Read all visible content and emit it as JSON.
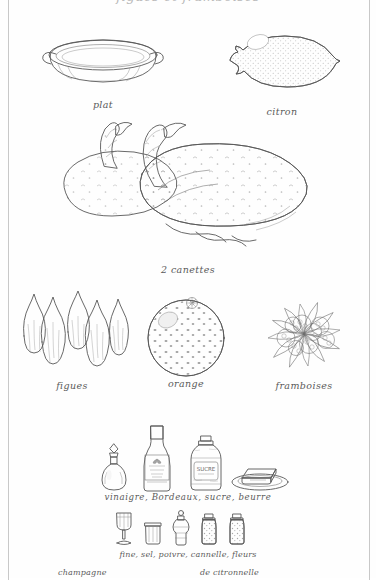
{
  "page": {
    "top_cut_text": "figues et framboises",
    "background_color": "#fefefe",
    "frame_color": "#c8c8c8",
    "ink_color": "#585858"
  },
  "rows": [
    {
      "name": "row-dish-lemon",
      "items": [
        {
          "name": "plat",
          "caption": "plat",
          "icon": "oval-gratin-dish"
        },
        {
          "name": "citron",
          "caption": "citron",
          "icon": "lemon"
        }
      ]
    },
    {
      "name": "row-ducks",
      "items": [
        {
          "name": "canettes",
          "caption": "2 canettes",
          "icon": "two-plucked-ducks"
        }
      ]
    },
    {
      "name": "row-fruit",
      "items": [
        {
          "name": "figues",
          "caption": "figues",
          "icon": "five-figs"
        },
        {
          "name": "orange",
          "caption": "orange",
          "icon": "orange"
        },
        {
          "name": "framboises",
          "caption": "framboises",
          "icon": "raspberries-on-leaves"
        }
      ]
    },
    {
      "name": "row-pantry",
      "caption": "vinaigre, Bordeaux, sucre,   beurre",
      "items": [
        {
          "name": "vinaigre",
          "icon": "cruet-bottle"
        },
        {
          "name": "bordeaux",
          "icon": "wine-bottle"
        },
        {
          "name": "sucre",
          "icon": "sugar-jar",
          "label_text": "SUCRE"
        },
        {
          "name": "beurre",
          "icon": "butter-on-dish"
        }
      ]
    },
    {
      "name": "row-spices",
      "caption_line_1": "fine, sel, poivre, cannelle, fleurs",
      "caption_line_2_left": "champagne",
      "caption_line_2_right": "de citronnelle",
      "items": [
        {
          "name": "fine-champagne",
          "icon": "brandy-glass"
        },
        {
          "name": "sel",
          "icon": "salt-cellar"
        },
        {
          "name": "poivre",
          "icon": "pepper-mill"
        },
        {
          "name": "cannelle",
          "icon": "spice-jar-cinnamon"
        },
        {
          "name": "fleurs-de-citronnelle",
          "icon": "spice-jar-lemongrass"
        }
      ]
    }
  ]
}
